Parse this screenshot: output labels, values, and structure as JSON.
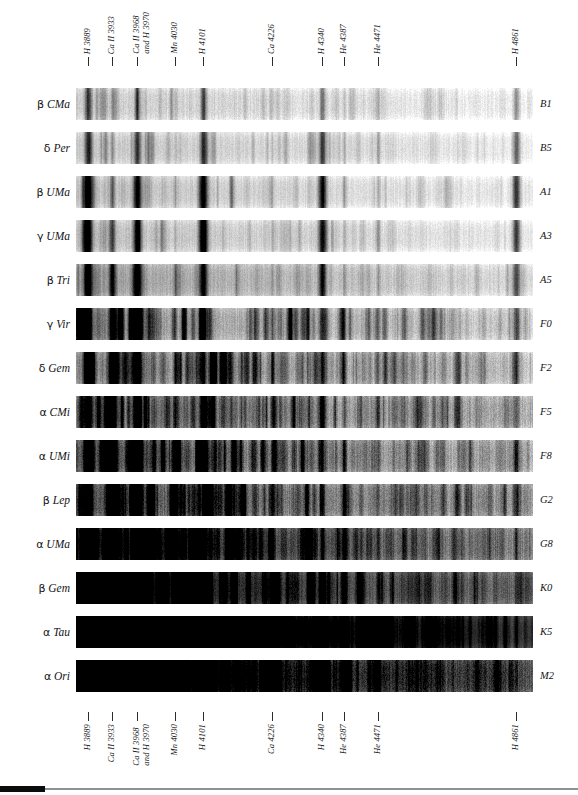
{
  "figure": {
    "kind": "spectra-plate"
  },
  "axis": {
    "lines": [
      {
        "id": "h-3889",
        "label": "H 3889",
        "x_px": 88,
        "wavelength": 3889
      },
      {
        "id": "ca-ii-3933",
        "label": "Ca II 3933",
        "x_px": 112,
        "wavelength": 3933
      },
      {
        "id": "ca-ii-3968",
        "label": "Ca II 3968\nand H 3970",
        "x_px": 137,
        "wavelength": 3968
      },
      {
        "id": "mn-4030",
        "label": "Mn 4030",
        "x_px": 175,
        "wavelength": 4030
      },
      {
        "id": "h-4101",
        "label": "H 4101",
        "x_px": 203,
        "wavelength": 4101
      },
      {
        "id": "ca-4226",
        "label": "Ca 4226",
        "x_px": 272,
        "wavelength": 4226
      },
      {
        "id": "h-4340",
        "label": "H 4340",
        "x_px": 322,
        "wavelength": 4340
      },
      {
        "id": "he-4387",
        "label": "He 4387",
        "x_px": 344,
        "wavelength": 4387
      },
      {
        "id": "he-4471",
        "label": "He 4471",
        "x_px": 378,
        "wavelength": 4471
      },
      {
        "id": "h-4861",
        "label": "H 4861",
        "x_px": 516,
        "wavelength": 4861
      }
    ]
  },
  "chart_data": {
    "type": "heatmap",
    "xlabel": "Wavelength (Å)",
    "ylabel": "Star",
    "xlim": [
      3860,
      4900
    ],
    "grid": false,
    "legend": null,
    "annotations": [
      "H 3889",
      "Ca II 3933",
      "Ca II 3968 and H 3970",
      "Mn 4030",
      "H 4101",
      "Ca 4226",
      "H 4340",
      "He 4387",
      "He 4471",
      "H 4861"
    ],
    "categories": [
      "β CMa",
      "δ Per",
      "β UMa",
      "γ UMa",
      "β Tri",
      "γ Vir",
      "δ Gem",
      "α CMi",
      "α UMi",
      "β Lep",
      "α UMa",
      "β Gem",
      "α Tau",
      "α Ori"
    ],
    "series": [
      {
        "name": "spectral type",
        "values": [
          "B1",
          "B5",
          "A1",
          "A3",
          "A5",
          "F0",
          "F2",
          "F5",
          "F8",
          "G2",
          "G8",
          "K0",
          "K5",
          "M2"
        ]
      },
      {
        "name": "continuum darkness (0 bright - 1 dark)",
        "values": [
          0.14,
          0.16,
          0.14,
          0.15,
          0.18,
          0.22,
          0.24,
          0.28,
          0.33,
          0.38,
          0.48,
          0.56,
          0.78,
          0.7
        ]
      }
    ]
  },
  "rows": [
    {
      "star": "β CMa",
      "greek": "β",
      "bayer": "CMa",
      "type": "B1",
      "top_px": 0,
      "base": 0.1,
      "blue_tilt": 0.1,
      "grain": 0.16,
      "banded": false,
      "lines": [
        {
          "x": 88,
          "w": 4.0,
          "d": 0.62
        },
        {
          "x": 112,
          "w": 2.2,
          "d": 0.2
        },
        {
          "x": 137,
          "w": 3.6,
          "d": 0.5
        },
        {
          "x": 175,
          "w": 1.8,
          "d": 0.1
        },
        {
          "x": 203,
          "w": 3.6,
          "d": 0.52
        },
        {
          "x": 272,
          "w": 1.6,
          "d": 0.08
        },
        {
          "x": 322,
          "w": 3.6,
          "d": 0.46
        },
        {
          "x": 344,
          "w": 1.8,
          "d": 0.16
        },
        {
          "x": 378,
          "w": 2.2,
          "d": 0.2
        },
        {
          "x": 516,
          "w": 4.0,
          "d": 0.4
        }
      ]
    },
    {
      "star": "δ Per",
      "greek": "δ",
      "bayer": "Per",
      "type": "B5",
      "top_px": 44,
      "base": 0.12,
      "blue_tilt": 0.1,
      "grain": 0.14,
      "banded": false,
      "lines": [
        {
          "x": 88,
          "w": 4.6,
          "d": 0.68
        },
        {
          "x": 112,
          "w": 2.4,
          "d": 0.26
        },
        {
          "x": 137,
          "w": 4.4,
          "d": 0.62
        },
        {
          "x": 175,
          "w": 1.8,
          "d": 0.1
        },
        {
          "x": 203,
          "w": 4.4,
          "d": 0.66
        },
        {
          "x": 272,
          "w": 1.6,
          "d": 0.1
        },
        {
          "x": 322,
          "w": 4.4,
          "d": 0.62
        },
        {
          "x": 344,
          "w": 2.0,
          "d": 0.22
        },
        {
          "x": 378,
          "w": 2.6,
          "d": 0.28
        },
        {
          "x": 516,
          "w": 4.6,
          "d": 0.56
        }
      ]
    },
    {
      "star": "β UMa",
      "greek": "β",
      "bayer": "UMa",
      "type": "A1",
      "top_px": 88,
      "base": 0.12,
      "blue_tilt": 0.12,
      "grain": 0.14,
      "banded": false,
      "lines": [
        {
          "x": 88,
          "w": 5.4,
          "d": 0.9
        },
        {
          "x": 112,
          "w": 3.2,
          "d": 0.44
        },
        {
          "x": 137,
          "w": 5.4,
          "d": 0.88
        },
        {
          "x": 175,
          "w": 1.8,
          "d": 0.12
        },
        {
          "x": 203,
          "w": 5.4,
          "d": 0.9
        },
        {
          "x": 272,
          "w": 1.8,
          "d": 0.12
        },
        {
          "x": 322,
          "w": 5.2,
          "d": 0.86
        },
        {
          "x": 344,
          "w": 2.0,
          "d": 0.18
        },
        {
          "x": 378,
          "w": 2.4,
          "d": 0.22
        },
        {
          "x": 516,
          "w": 5.0,
          "d": 0.72
        }
      ]
    },
    {
      "star": "γ UMa",
      "greek": "γ",
      "bayer": "UMa",
      "type": "A3",
      "top_px": 132,
      "base": 0.13,
      "blue_tilt": 0.12,
      "grain": 0.15,
      "banded": false,
      "lines": [
        {
          "x": 88,
          "w": 5.2,
          "d": 0.88
        },
        {
          "x": 112,
          "w": 3.6,
          "d": 0.52
        },
        {
          "x": 137,
          "w": 5.2,
          "d": 0.88
        },
        {
          "x": 175,
          "w": 1.8,
          "d": 0.14
        },
        {
          "x": 203,
          "w": 5.0,
          "d": 0.86
        },
        {
          "x": 272,
          "w": 1.8,
          "d": 0.14
        },
        {
          "x": 322,
          "w": 5.0,
          "d": 0.84
        },
        {
          "x": 344,
          "w": 2.0,
          "d": 0.2
        },
        {
          "x": 378,
          "w": 2.2,
          "d": 0.2
        },
        {
          "x": 516,
          "w": 4.8,
          "d": 0.7
        }
      ]
    },
    {
      "star": "β Tri",
      "greek": "β",
      "bayer": "Tri",
      "type": "A5",
      "top_px": 176,
      "base": 0.2,
      "blue_tilt": 0.18,
      "grain": 0.16,
      "banded": false,
      "lines": [
        {
          "x": 88,
          "w": 5.6,
          "d": 0.86
        },
        {
          "x": 112,
          "w": 4.4,
          "d": 0.72
        },
        {
          "x": 137,
          "w": 5.6,
          "d": 0.86
        },
        {
          "x": 175,
          "w": 2.0,
          "d": 0.18
        },
        {
          "x": 203,
          "w": 5.0,
          "d": 0.8
        },
        {
          "x": 272,
          "w": 2.0,
          "d": 0.18
        },
        {
          "x": 322,
          "w": 4.8,
          "d": 0.76
        },
        {
          "x": 344,
          "w": 2.2,
          "d": 0.22
        },
        {
          "x": 378,
          "w": 2.2,
          "d": 0.2
        },
        {
          "x": 516,
          "w": 4.6,
          "d": 0.6
        }
      ]
    },
    {
      "star": "γ Vir",
      "greek": "γ",
      "bayer": "Vir",
      "type": "F0",
      "top_px": 220,
      "base": 0.22,
      "blue_tilt": 0.2,
      "grain": 0.2,
      "banded": true,
      "lines": [
        {
          "x": 88,
          "w": 5.0,
          "d": 0.74
        },
        {
          "x": 112,
          "w": 5.0,
          "d": 0.8
        },
        {
          "x": 137,
          "w": 5.4,
          "d": 0.82
        },
        {
          "x": 175,
          "w": 2.2,
          "d": 0.24
        },
        {
          "x": 203,
          "w": 4.4,
          "d": 0.66
        },
        {
          "x": 272,
          "w": 2.2,
          "d": 0.24
        },
        {
          "x": 322,
          "w": 4.2,
          "d": 0.62
        },
        {
          "x": 344,
          "w": 2.4,
          "d": 0.28
        },
        {
          "x": 378,
          "w": 2.2,
          "d": 0.22
        },
        {
          "x": 516,
          "w": 4.2,
          "d": 0.5
        }
      ]
    },
    {
      "star": "δ Gem",
      "greek": "δ",
      "bayer": "Gem",
      "type": "F2",
      "top_px": 264,
      "base": 0.26,
      "blue_tilt": 0.22,
      "grain": 0.22,
      "banded": true,
      "lines": [
        {
          "x": 88,
          "w": 5.2,
          "d": 0.8
        },
        {
          "x": 112,
          "w": 5.6,
          "d": 0.88
        },
        {
          "x": 137,
          "w": 5.8,
          "d": 0.88
        },
        {
          "x": 175,
          "w": 2.4,
          "d": 0.28
        },
        {
          "x": 203,
          "w": 4.2,
          "d": 0.64
        },
        {
          "x": 272,
          "w": 2.4,
          "d": 0.28
        },
        {
          "x": 322,
          "w": 4.2,
          "d": 0.62
        },
        {
          "x": 344,
          "w": 2.6,
          "d": 0.3
        },
        {
          "x": 378,
          "w": 2.2,
          "d": 0.24
        },
        {
          "x": 516,
          "w": 4.0,
          "d": 0.46
        }
      ]
    },
    {
      "star": "α CMi",
      "greek": "α",
      "bayer": "CMi",
      "type": "F5",
      "top_px": 308,
      "base": 0.3,
      "blue_tilt": 0.24,
      "grain": 0.24,
      "banded": true,
      "lines": [
        {
          "x": 88,
          "w": 5.0,
          "d": 0.76
        },
        {
          "x": 112,
          "w": 6.0,
          "d": 0.9
        },
        {
          "x": 137,
          "w": 6.0,
          "d": 0.9
        },
        {
          "x": 175,
          "w": 2.6,
          "d": 0.32
        },
        {
          "x": 203,
          "w": 4.0,
          "d": 0.58
        },
        {
          "x": 272,
          "w": 2.6,
          "d": 0.32
        },
        {
          "x": 322,
          "w": 3.8,
          "d": 0.56
        },
        {
          "x": 344,
          "w": 2.6,
          "d": 0.32
        },
        {
          "x": 378,
          "w": 2.2,
          "d": 0.24
        },
        {
          "x": 516,
          "w": 3.6,
          "d": 0.42
        }
      ]
    },
    {
      "star": "α UMi",
      "greek": "α",
      "bayer": "UMi",
      "type": "F8",
      "top_px": 352,
      "base": 0.34,
      "blue_tilt": 0.26,
      "grain": 0.26,
      "banded": true,
      "lines": [
        {
          "x": 88,
          "w": 5.0,
          "d": 0.78
        },
        {
          "x": 112,
          "w": 6.2,
          "d": 0.92
        },
        {
          "x": 137,
          "w": 6.2,
          "d": 0.92
        },
        {
          "x": 175,
          "w": 2.8,
          "d": 0.36
        },
        {
          "x": 203,
          "w": 3.8,
          "d": 0.54
        },
        {
          "x": 272,
          "w": 2.8,
          "d": 0.36
        },
        {
          "x": 322,
          "w": 3.6,
          "d": 0.52
        },
        {
          "x": 344,
          "w": 2.8,
          "d": 0.34
        },
        {
          "x": 378,
          "w": 2.2,
          "d": 0.24
        },
        {
          "x": 516,
          "w": 3.4,
          "d": 0.4
        }
      ]
    },
    {
      "star": "β Lep",
      "greek": "β",
      "bayer": "Lep",
      "type": "G2",
      "top_px": 396,
      "base": 0.4,
      "blue_tilt": 0.3,
      "grain": 0.26,
      "banded": true,
      "lines": [
        {
          "x": 88,
          "w": 5.2,
          "d": 0.82
        },
        {
          "x": 112,
          "w": 6.4,
          "d": 0.94
        },
        {
          "x": 137,
          "w": 6.4,
          "d": 0.94
        },
        {
          "x": 175,
          "w": 3.0,
          "d": 0.42
        },
        {
          "x": 203,
          "w": 3.6,
          "d": 0.52
        },
        {
          "x": 272,
          "w": 3.0,
          "d": 0.42
        },
        {
          "x": 322,
          "w": 3.4,
          "d": 0.5
        },
        {
          "x": 344,
          "w": 3.0,
          "d": 0.4
        },
        {
          "x": 378,
          "w": 2.2,
          "d": 0.26
        },
        {
          "x": 516,
          "w": 3.2,
          "d": 0.36
        }
      ]
    },
    {
      "star": "α UMa",
      "greek": "α",
      "bayer": "UMa",
      "type": "G8",
      "top_px": 440,
      "base": 0.5,
      "blue_tilt": 0.38,
      "grain": 0.24,
      "banded": true,
      "lines": [
        {
          "x": 88,
          "w": 6.0,
          "d": 0.9
        },
        {
          "x": 112,
          "w": 7.0,
          "d": 0.96
        },
        {
          "x": 137,
          "w": 7.0,
          "d": 0.96
        },
        {
          "x": 175,
          "w": 3.4,
          "d": 0.52
        },
        {
          "x": 203,
          "w": 3.4,
          "d": 0.5
        },
        {
          "x": 272,
          "w": 3.4,
          "d": 0.52
        },
        {
          "x": 322,
          "w": 3.2,
          "d": 0.48
        },
        {
          "x": 344,
          "w": 3.2,
          "d": 0.46
        },
        {
          "x": 378,
          "w": 2.4,
          "d": 0.3
        },
        {
          "x": 516,
          "w": 3.0,
          "d": 0.32
        }
      ]
    },
    {
      "star": "β Gem",
      "greek": "β",
      "bayer": "Gem",
      "type": "K0",
      "top_px": 484,
      "base": 0.58,
      "blue_tilt": 0.44,
      "grain": 0.22,
      "banded": true,
      "lines": [
        {
          "x": 88,
          "w": 7.0,
          "d": 0.96
        },
        {
          "x": 112,
          "w": 8.0,
          "d": 0.98
        },
        {
          "x": 137,
          "w": 8.0,
          "d": 0.98
        },
        {
          "x": 175,
          "w": 4.0,
          "d": 0.62
        },
        {
          "x": 203,
          "w": 3.4,
          "d": 0.56
        },
        {
          "x": 272,
          "w": 4.0,
          "d": 0.62
        },
        {
          "x": 322,
          "w": 3.2,
          "d": 0.52
        },
        {
          "x": 344,
          "w": 3.4,
          "d": 0.52
        },
        {
          "x": 378,
          "w": 2.4,
          "d": 0.32
        },
        {
          "x": 516,
          "w": 2.8,
          "d": 0.3
        }
      ]
    },
    {
      "star": "α Tau",
      "greek": "α",
      "bayer": "Tau",
      "type": "K5",
      "top_px": 528,
      "base": 0.82,
      "blue_tilt": 0.6,
      "grain": 0.14,
      "banded": true,
      "lines": [
        {
          "x": 88,
          "w": 9.0,
          "d": 0.99
        },
        {
          "x": 112,
          "w": 10.0,
          "d": 0.99
        },
        {
          "x": 137,
          "w": 10.0,
          "d": 0.99
        },
        {
          "x": 175,
          "w": 5.0,
          "d": 0.9
        },
        {
          "x": 203,
          "w": 4.4,
          "d": 0.88
        },
        {
          "x": 272,
          "w": 5.0,
          "d": 0.9
        },
        {
          "x": 322,
          "w": 4.0,
          "d": 0.8
        },
        {
          "x": 344,
          "w": 4.0,
          "d": 0.74
        },
        {
          "x": 378,
          "w": 3.0,
          "d": 0.54
        },
        {
          "x": 516,
          "w": 2.6,
          "d": 0.28
        }
      ]
    },
    {
      "star": "α Ori",
      "greek": "α",
      "bayer": "Ori",
      "type": "M2",
      "top_px": 572,
      "base": 0.72,
      "blue_tilt": 0.46,
      "grain": 0.3,
      "banded": true,
      "lines": [
        {
          "x": 88,
          "w": 8.0,
          "d": 0.97
        },
        {
          "x": 112,
          "w": 9.0,
          "d": 0.98
        },
        {
          "x": 137,
          "w": 9.0,
          "d": 0.98
        },
        {
          "x": 175,
          "w": 5.0,
          "d": 0.86
        },
        {
          "x": 203,
          "w": 4.4,
          "d": 0.84
        },
        {
          "x": 272,
          "w": 5.2,
          "d": 0.88
        },
        {
          "x": 322,
          "w": 4.2,
          "d": 0.78
        },
        {
          "x": 344,
          "w": 4.0,
          "d": 0.72
        },
        {
          "x": 378,
          "w": 3.2,
          "d": 0.56
        },
        {
          "x": 516,
          "w": 2.6,
          "d": 0.26
        }
      ]
    }
  ],
  "colors": {
    "ink": "#141416",
    "tick": "#2c2c2e",
    "footer_bar": "#0b0b0c",
    "footer_rule": "#8f9194",
    "paper": "#ffffff"
  }
}
